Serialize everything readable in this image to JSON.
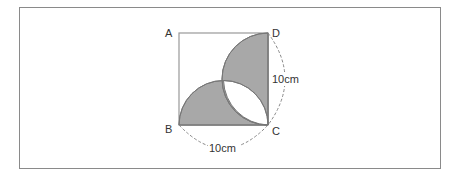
{
  "figure": {
    "type": "geometry-diagram",
    "vertices": {
      "A": "A",
      "B": "B",
      "C": "C",
      "D": "D"
    },
    "dimensions": {
      "side_cd": "10cm",
      "side_bc": "10cm"
    },
    "colors": {
      "shade": "#a8a8a8",
      "outline": "#777777",
      "square_edge": "#999999",
      "dashed": "#888888",
      "frame": "#8a8a8a",
      "lens": "#ffffff"
    }
  }
}
